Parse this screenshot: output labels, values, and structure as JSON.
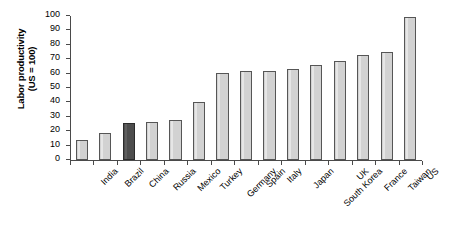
{
  "chart_data": {
    "type": "bar",
    "title": "",
    "xlabel": "",
    "ylabel": "Labor productivity (US = 100)",
    "ylabel_line1": "Labor productivity",
    "ylabel_line2": "(US = 100)",
    "ylim": [
      0,
      100
    ],
    "ytick_values": [
      0,
      10,
      20,
      30,
      40,
      50,
      60,
      70,
      80,
      90,
      100
    ],
    "ytick_labels": [
      "0",
      "10",
      "20",
      "30",
      "40",
      "50",
      "60",
      "70",
      "80",
      "90",
      "100"
    ],
    "grid": false,
    "legend": "none",
    "categories": [
      "India",
      "Brazil",
      "China",
      "Russia",
      "Mexico",
      "Turkey",
      "Germany",
      "Spain",
      "Italy",
      "Japan",
      "South Korea",
      "UK",
      "France",
      "Taiwan",
      "US"
    ],
    "values": [
      14,
      18.5,
      25.5,
      26.5,
      27.5,
      40.5,
      60.5,
      61.5,
      62,
      63,
      66,
      69,
      73,
      75,
      99
    ],
    "highlight_category": "China",
    "colors": {
      "bar_fill": "#d2d2d2",
      "bar_edge": "#565656",
      "highlight_fill": "#4d4d4d",
      "highlight_edge": "#2b2b2b",
      "axis": "#4a4a4a",
      "text": "#000000",
      "background": "#ffffff"
    }
  }
}
